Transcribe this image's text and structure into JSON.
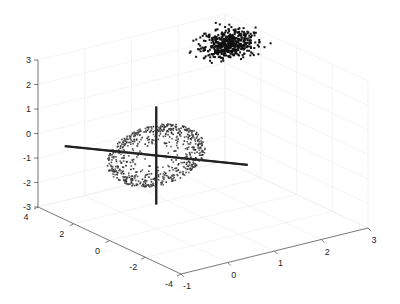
{
  "chart_data": {
    "type": "scatter3d",
    "title": "",
    "xlabel": "",
    "ylabel": "",
    "zlabel": "",
    "axes": {
      "x": {
        "range": [
          -1,
          3
        ],
        "ticks": [
          -1,
          0,
          1,
          2,
          3
        ],
        "tick_labels": [
          "-1",
          "0",
          "1",
          "2",
          "3"
        ]
      },
      "y": {
        "range": [
          -4,
          4
        ],
        "ticks": [
          -4,
          -2,
          0,
          2,
          4
        ],
        "tick_labels": [
          "-4",
          "-2",
          "0",
          "2",
          "4"
        ]
      },
      "z": {
        "range": [
          -3,
          3
        ],
        "ticks": [
          -3,
          -2,
          -1,
          0,
          1,
          2,
          3
        ],
        "tick_labels": [
          "-3",
          "-2",
          "-1",
          "0",
          "1",
          "2",
          "3"
        ]
      }
    },
    "grid": true,
    "legend": null,
    "series": [
      {
        "name": "ellipsoid-surface-points",
        "kind": "scatter",
        "color": "#3a3a3a",
        "description": "points on an ellipsoid centered near origin, semi-axes approx 1.5 (x), 1 (y), 0.8 (z), tilted",
        "center": [
          0,
          0,
          0
        ],
        "semi_axes_px": [
          50,
          30
        ],
        "rotation_deg": -14,
        "count": 700
      },
      {
        "name": "dense-cluster",
        "kind": "scatter",
        "color": "#111111",
        "description": "Gaussian cluster at high z, far back-right",
        "center": [
          2.5,
          3.5,
          3.2
        ],
        "count": 500
      },
      {
        "name": "principal-axis-vertical",
        "kind": "line",
        "color": "#222222",
        "from": [
          0,
          0,
          2
        ],
        "to": [
          0,
          0,
          -2
        ]
      },
      {
        "name": "principal-axis-diagonal",
        "kind": "line",
        "color": "#222222",
        "from": [
          -1,
          2.5,
          0
        ],
        "to": [
          1,
          -2.5,
          0
        ]
      }
    ]
  }
}
